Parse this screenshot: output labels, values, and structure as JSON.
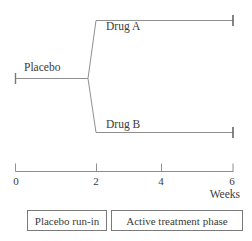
{
  "figure": {
    "arms": {
      "placebo": "Placebo",
      "drug_a": "Drug A",
      "drug_b": "Drug B"
    },
    "axis": {
      "tick_labels": [
        "0",
        "2",
        "4",
        "6"
      ],
      "unit": "Weeks"
    },
    "phases": {
      "run_in": "Placebo run-in",
      "active": "Active treatment phase"
    },
    "colors": {
      "line": "#8f8f8f",
      "end_tick": "#666666",
      "text": "#3b3b3b",
      "box_border": "#7a7a7a",
      "background": "#ffffff"
    }
  }
}
